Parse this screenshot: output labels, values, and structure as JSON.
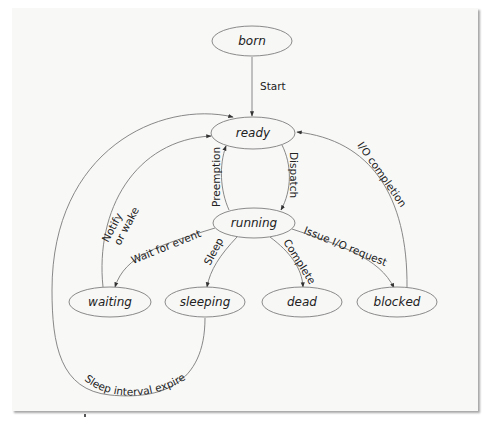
{
  "diagram": {
    "type": "state-transition",
    "colors": {
      "frame_background": "#f8f8f7",
      "node_fill": "#f7f7f6",
      "node_stroke": "#8a8a8a",
      "edge_stroke": "#7a7a7a",
      "text": "#222222"
    },
    "nodes": {
      "born": {
        "label": "born",
        "cx": 252,
        "cy": 41,
        "rx": 40,
        "ry": 15
      },
      "ready": {
        "label": "ready",
        "cx": 253,
        "cy": 133,
        "rx": 42,
        "ry": 16
      },
      "running": {
        "label": "running",
        "cx": 254,
        "cy": 223,
        "rx": 41,
        "ry": 15
      },
      "waiting": {
        "label": "waiting",
        "cx": 110,
        "cy": 302,
        "rx": 41,
        "ry": 15
      },
      "sleeping": {
        "label": "sleeping",
        "cx": 205,
        "cy": 302,
        "rx": 40,
        "ry": 15
      },
      "dead": {
        "label": "dead",
        "cx": 302,
        "cy": 302,
        "rx": 40,
        "ry": 15
      },
      "blocked": {
        "label": "blocked",
        "cx": 397,
        "cy": 302,
        "rx": 40,
        "ry": 15
      }
    },
    "edges": {
      "start": {
        "from": "born",
        "to": "ready",
        "label": "Start"
      },
      "dispatch": {
        "from": "ready",
        "to": "running",
        "label": "Dispatch"
      },
      "preemption": {
        "from": "running",
        "to": "ready",
        "label": "Preemption"
      },
      "wait_for_event": {
        "from": "running",
        "to": "waiting",
        "label": "Wait for event"
      },
      "sleep": {
        "from": "running",
        "to": "sleeping",
        "label": "Sleep"
      },
      "complete": {
        "from": "running",
        "to": "dead",
        "label": "Complete"
      },
      "issue_io": {
        "from": "running",
        "to": "blocked",
        "label": "Issue I/O request"
      },
      "io_completion": {
        "from": "blocked",
        "to": "ready",
        "label": "I/O completion"
      },
      "notify_line1": {
        "from": "waiting",
        "to": "ready",
        "label": "Notify"
      },
      "notify_line2": {
        "label": "or wake"
      },
      "sleep_expires": {
        "from": "sleeping",
        "to": "ready",
        "label": "Sleep interval expires"
      }
    }
  }
}
